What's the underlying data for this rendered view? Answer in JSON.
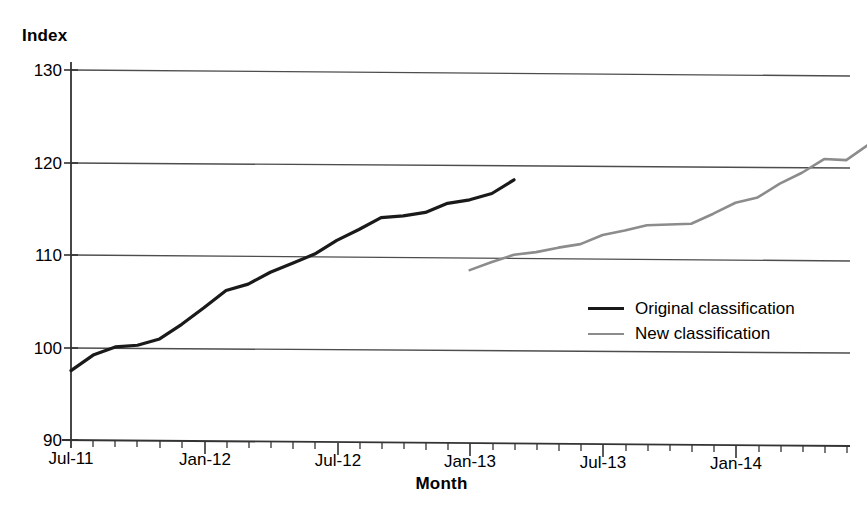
{
  "chart_data": {
    "type": "line",
    "title": "",
    "xlabel": "Month",
    "ylabel": "Index",
    "ylim": [
      90,
      130
    ],
    "yticks": [
      90,
      100,
      110,
      120,
      130
    ],
    "xlim": [
      "Jul-11",
      "Jul-14"
    ],
    "xticks": [
      "Jul-11",
      "Jan-12",
      "Jul-12",
      "Jan-13",
      "Jul-13",
      "Jan-14"
    ],
    "xtick_minor_interval_months": 1,
    "grid": "horizontal",
    "legend_position": "center-right",
    "series": [
      {
        "name": "Original classification",
        "color": "#1a1a1a",
        "x": [
          "Jul-11",
          "Aug-11",
          "Sep-11",
          "Oct-11",
          "Nov-11",
          "Dec-11",
          "Jan-12",
          "Feb-12",
          "Mar-12",
          "Apr-12",
          "May-12",
          "Jun-12",
          "Jul-12",
          "Aug-12",
          "Sep-12",
          "Oct-12",
          "Nov-12",
          "Dec-12",
          "Jan-13",
          "Feb-13"
        ],
        "values": [
          97.5,
          99.2,
          100.1,
          100.3,
          101.0,
          102.6,
          104.4,
          106.3,
          107.0,
          108.3,
          109.3,
          110.3,
          111.8,
          113.0,
          114.3,
          114.5,
          114.9,
          115.9,
          116.3,
          117.0
        ]
      },
      {
        "name": "New classification",
        "color": "#8c8c8c",
        "x": [
          "Jan-13",
          "Feb-13",
          "Mar-13",
          "Apr-13",
          "May-13",
          "Jun-13",
          "Jul-13",
          "Aug-13",
          "Sep-13",
          "Oct-13",
          "Nov-13",
          "Dec-13",
          "Jan-14",
          "Feb-14",
          "Mar-14",
          "Apr-14",
          "May-14",
          "Jun-14"
        ],
        "values": [
          108.7,
          109.6,
          110.4,
          110.7,
          111.2,
          111.6,
          112.6,
          113.1,
          113.7,
          113.8,
          113.9,
          115.0,
          116.2,
          116.8,
          118.3,
          119.5,
          121.0,
          120.9
        ]
      }
    ],
    "series_extra_points": {
      "Original classification": {
        "final_x": "Feb-13",
        "final_value": 118.5
      },
      "New classification": {
        "final_x": "Jul-14",
        "final_value": 122.6
      }
    }
  },
  "legend": {
    "entries": [
      {
        "label": "Original classification",
        "color": "#1a1a1a"
      },
      {
        "label": "New classification",
        "color": "#8c8c8c"
      }
    ]
  },
  "axes": {
    "y_title": "Index",
    "x_title": "Month",
    "y_labels": [
      "130",
      "120",
      "110",
      "100",
      "90"
    ],
    "x_labels": [
      "Jul-11",
      "Jan-12",
      "Jul-12",
      "Jan-13",
      "Jul-13",
      "Jan-14"
    ]
  },
  "colors": {
    "original_line": "#1a1a1a",
    "new_line": "#8c8c8c",
    "gridline": "#4d4d4d",
    "axis": "#333333",
    "background": "#ffffff"
  }
}
